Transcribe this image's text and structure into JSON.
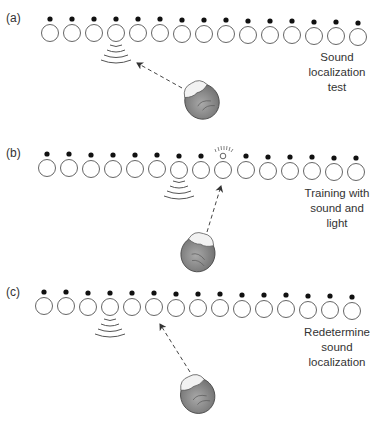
{
  "figure": {
    "panels": [
      {
        "label": "(a)",
        "caption": [
          "Sound",
          "localization",
          "test"
        ],
        "speaker_count": 14,
        "sound_source_index": 3,
        "light_index": null,
        "pointed_index": 3
      },
      {
        "label": "(b)",
        "caption": [
          "Training with",
          "sound and",
          "light"
        ],
        "speaker_count": 14,
        "sound_source_index": 6,
        "light_index": 7,
        "pointed_index": 7
      },
      {
        "label": "(c)",
        "caption": [
          "Redetermine",
          "sound",
          "localization"
        ],
        "speaker_count": 14,
        "sound_source_index": 3,
        "light_index": null,
        "pointed_index": 5
      }
    ],
    "colors": {
      "line": "#555555",
      "dot": "#111111",
      "head_fill": "#8a8a8a",
      "text": "#333333"
    }
  }
}
